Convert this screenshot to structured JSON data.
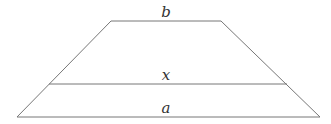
{
  "diagram": {
    "type": "trapezoid",
    "line_color": "#777777",
    "label_color": "#333333",
    "labels": {
      "top": "b",
      "middle": "x",
      "bottom": "a"
    },
    "vertices": {
      "top_left": [
        111,
        21
      ],
      "top_right": [
        221,
        21
      ],
      "bottom_right": [
        320,
        117
      ],
      "bottom_left": [
        17,
        117
      ]
    },
    "middle_segment": {
      "x1": 49,
      "x2": 287,
      "y": 84
    }
  }
}
